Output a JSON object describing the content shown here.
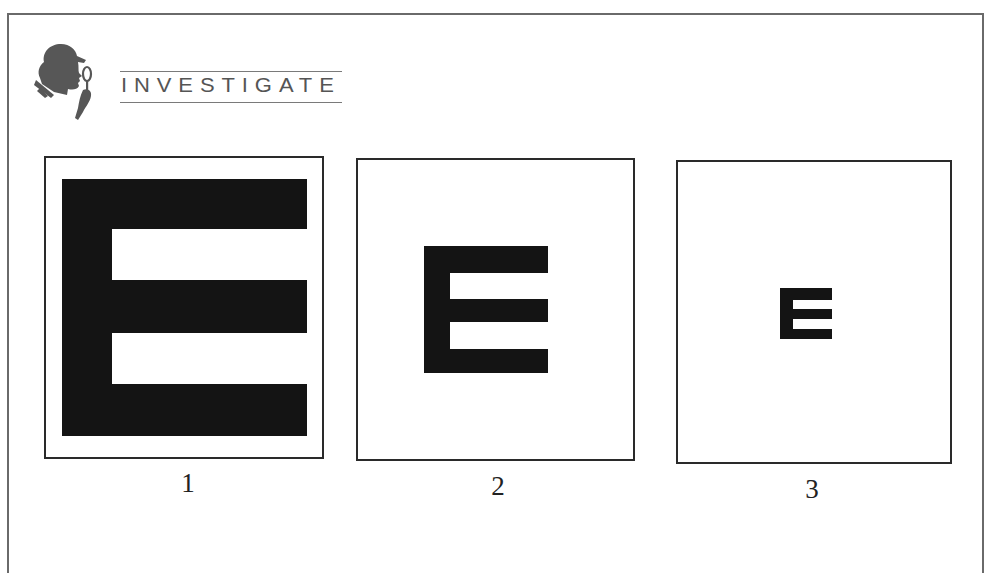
{
  "header": {
    "logo_icon": "detective-magnifier-icon",
    "title": "INVESTIGATE"
  },
  "panels": [
    {
      "label": "1",
      "content": "E",
      "size": "large"
    },
    {
      "label": "2",
      "content": "E",
      "size": "medium"
    },
    {
      "label": "3",
      "content": "E",
      "size": "small"
    }
  ],
  "colors": {
    "ink": "#141414",
    "logo_grey": "#555555",
    "border": "#2a2a2a"
  }
}
